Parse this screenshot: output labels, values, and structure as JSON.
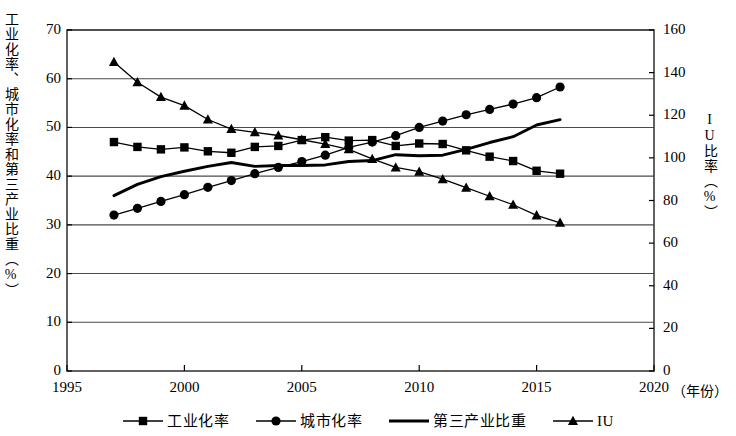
{
  "chart_data": {
    "type": "line",
    "title": "",
    "xlabel": "年份",
    "ylabel": "工业化率、城市化率和第三产业比重（%）",
    "ylabel_right": "IU比率（%）",
    "xlim": [
      1995,
      2020
    ],
    "ylim": [
      0,
      70
    ],
    "ylim_right": [
      0,
      160
    ],
    "xticks": [
      "1995",
      "2000",
      "2005",
      "2010",
      "2015",
      "2020"
    ],
    "yticks_left": [
      "0",
      "10",
      "20",
      "30",
      "40",
      "50",
      "60",
      "70"
    ],
    "yticks_right": [
      "0",
      "20",
      "40",
      "60",
      "80",
      "100",
      "120",
      "140",
      "160"
    ],
    "grid": true,
    "legend_position": "bottom",
    "x": [
      1997,
      1998,
      1999,
      2000,
      2001,
      2002,
      2003,
      2004,
      2005,
      2006,
      2007,
      2008,
      2009,
      2010,
      2011,
      2012,
      2013,
      2014,
      2015,
      2016
    ],
    "series": [
      {
        "name": "工业化率",
        "marker": "square",
        "axis": "left",
        "values": [
          47.0,
          46.0,
          45.5,
          45.9,
          45.1,
          44.8,
          46.0,
          46.2,
          47.4,
          48.0,
          47.3,
          47.4,
          46.2,
          46.7,
          46.6,
          45.3,
          44.0,
          43.1,
          41.1,
          40.5
        ]
      },
      {
        "name": "城市化率",
        "marker": "circle",
        "axis": "left",
        "values": [
          32.0,
          33.4,
          34.8,
          36.2,
          37.7,
          39.1,
          40.5,
          41.8,
          43.0,
          44.3,
          45.9,
          47.0,
          48.3,
          50.0,
          51.3,
          52.6,
          53.7,
          54.8,
          56.1,
          58.3
        ]
      },
      {
        "name": "第三产业比重",
        "marker": "none",
        "axis": "left",
        "values": [
          36.0,
          38.3,
          39.9,
          41.0,
          42.0,
          42.8,
          42.0,
          42.2,
          42.2,
          42.3,
          43.0,
          43.2,
          44.4,
          44.2,
          44.3,
          45.5,
          46.9,
          48.1,
          50.5,
          51.6
        ]
      },
      {
        "name": "IU",
        "marker": "triangle",
        "axis": "right",
        "values": [
          145.0,
          135.5,
          128.5,
          124.5,
          118.0,
          113.5,
          112.0,
          110.5,
          108.5,
          106.5,
          104.0,
          99.5,
          95.5,
          93.5,
          90.0,
          86.0,
          82.0,
          78.0,
          73.0,
          69.5
        ]
      }
    ]
  },
  "axes": {
    "left_label": "工业化率、城市化率和第三产业比重（%）",
    "right_label": "IU比率（%）",
    "x_unit": "（年份）"
  },
  "legend": {
    "items": [
      {
        "label": "工业化率",
        "marker": "square"
      },
      {
        "label": "城市化率",
        "marker": "circle"
      },
      {
        "label": "第三产业比重",
        "marker": "none"
      },
      {
        "label": "IU",
        "marker": "triangle"
      }
    ]
  }
}
